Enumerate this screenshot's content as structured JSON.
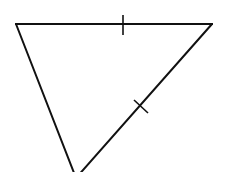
{
  "diagram": {
    "type": "geometry",
    "shape": "triangle",
    "stroke_color": "#111111",
    "background_color": "#ffffff",
    "stroke_width": 2,
    "vertices": {
      "top_left": [
        16,
        24
      ],
      "top_right": [
        212,
        24
      ],
      "bottom": [
        76,
        178
      ]
    },
    "sides": [
      {
        "name": "top",
        "from": "top_left",
        "to": "top_right",
        "tick_marks": 1
      },
      {
        "name": "right",
        "from": "top_right",
        "to": "bottom",
        "tick_marks": 1
      },
      {
        "name": "left",
        "from": "bottom",
        "to": "top_left",
        "tick_marks": 0
      }
    ],
    "ticks": [
      {
        "side": "top",
        "x1": 123,
        "y1": 15,
        "x2": 123,
        "y2": 35
      },
      {
        "side": "right",
        "x1": 134,
        "y1": 100,
        "x2": 148,
        "y2": 113
      }
    ],
    "annotation": "Tick marks indicate top side and right side are congruent (isosceles triangle)"
  }
}
